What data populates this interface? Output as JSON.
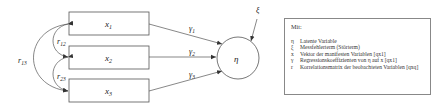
{
  "diagram": {
    "manifest_variables": [
      {
        "id": "x1",
        "label": "x",
        "sub": "1"
      },
      {
        "id": "x2",
        "label": "x",
        "sub": "2"
      },
      {
        "id": "x3",
        "label": "x",
        "sub": "3"
      }
    ],
    "latent_variable": {
      "label": "η"
    },
    "error_term": {
      "label": "ξ"
    },
    "paths": [
      {
        "from": "x1",
        "to": "eta",
        "label": "γ",
        "sub": "1"
      },
      {
        "from": "x2",
        "to": "eta",
        "label": "γ",
        "sub": "2"
      },
      {
        "from": "x3",
        "to": "eta",
        "label": "γ",
        "sub": "3"
      }
    ],
    "correlations": [
      {
        "between": [
          "x1",
          "x2"
        ],
        "label": "r",
        "sub": "12"
      },
      {
        "between": [
          "x2",
          "x3"
        ],
        "label": "r",
        "sub": "23"
      },
      {
        "between": [
          "x1",
          "x3"
        ],
        "label": "r",
        "sub": "13"
      }
    ]
  },
  "legend": {
    "title": "Mit:",
    "items": [
      {
        "symbol": "η",
        "text": "Latente Variable"
      },
      {
        "symbol": "ξ",
        "text": "Messfehlerterm (Störterm)"
      },
      {
        "symbol": "x",
        "text": "Vektor der manifesten Variablen [qx1]"
      },
      {
        "symbol": "γ",
        "text": "Regressionskoeffizienten von η auf x [qx1]"
      },
      {
        "symbol": "r",
        "text": "Korrelationsmatrix der beobachteten Variablen [qxq]"
      }
    ]
  },
  "colors": {
    "stroke": "#555555",
    "text": "#222222"
  }
}
